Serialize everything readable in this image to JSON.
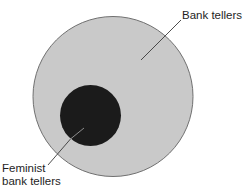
{
  "diagram": {
    "type": "venn-subset",
    "sets": [
      {
        "id": "bank_tellers",
        "label": "Bank tellers",
        "fill": "#c8c8c8",
        "stroke": "#6e6e6e"
      },
      {
        "id": "feminist_bank_tellers",
        "label_line1": "Feminist",
        "label_line2": "bank tellers",
        "fill": "#1a1a1a",
        "subset_of": "bank_tellers"
      }
    ]
  },
  "labels": {
    "outer": "Bank tellers",
    "inner_line1": "Feminist",
    "inner_line2": "bank tellers"
  }
}
